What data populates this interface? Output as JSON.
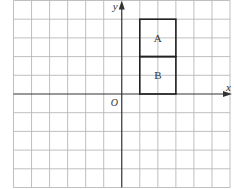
{
  "diagram": {
    "type": "coordinate-grid",
    "grid": {
      "x_min": -6,
      "x_max": 6,
      "y_min": -5,
      "y_max": 5,
      "cell": 1
    },
    "axes": {
      "x_label": "x",
      "y_label": "y",
      "origin_label": "O"
    },
    "shapes": [
      {
        "label": "A",
        "x0": 1,
        "y0": 2,
        "x1": 3,
        "y1": 4
      },
      {
        "label": "B",
        "x0": 1,
        "y0": 0,
        "x1": 3,
        "y1": 2
      }
    ],
    "colors": {
      "grid": "#b8b8b8",
      "axis": "#333333",
      "shape": "#222222",
      "text": "#333333"
    }
  }
}
